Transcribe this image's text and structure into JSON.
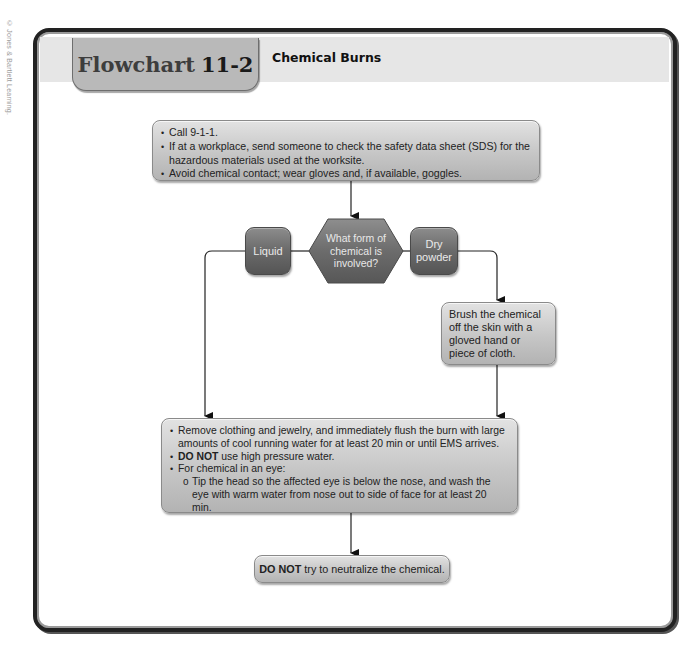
{
  "copyright": "© Jones & Bartlett Learning.",
  "header": {
    "label": "Flowchart",
    "number": "11-2",
    "subtitle": "Chemical Burns"
  },
  "nodes": {
    "initial_steps": {
      "items": [
        "Call 9-1-1.",
        "If at a workplace, send someone to check the safety data sheet (SDS) for the hazardous materials used at the worksite.",
        "Avoid chemical contact; wear gloves and, if available, goggles."
      ]
    },
    "decision": {
      "question": "What form of chemical is involved?"
    },
    "liquid": {
      "label": "Liquid"
    },
    "dry_powder": {
      "label": "Dry powder"
    },
    "brush": {
      "text": "Brush the chemical off the skin with a gloved hand or piece of cloth."
    },
    "flush": {
      "item1": "Remove clothing and jewelry, and immediately flush the burn with large amounts of cool running water for at least 20 min or until EMS arrives.",
      "item2_bold": "DO NOT",
      "item2_rest": " use high pressure water.",
      "item3": "For chemical in an eye:",
      "subitem": "Tip the head so the affected eye is below the nose, and wash the eye with warm water from nose out to side of face for at least 20 min."
    },
    "final": {
      "bold": "DO NOT",
      "rest": " try to neutralize the chemical."
    }
  },
  "colors": {
    "frame": "#222222",
    "light_box": "#c6c6c6",
    "dark_box": "#6a6a6a",
    "title_tab": "#b9b9b9",
    "header_band": "#e6e6e6"
  }
}
